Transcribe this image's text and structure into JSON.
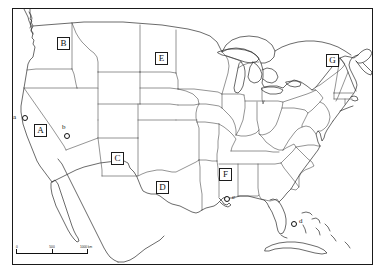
{
  "figure": {
    "background_color": "#ffffff",
    "line_color": "#2b2b2b",
    "frame": true
  },
  "region_labels": [
    {
      "id": "B",
      "label": "B",
      "x": 57,
      "y": 37
    },
    {
      "id": "E",
      "label": "E",
      "x": 155,
      "y": 52
    },
    {
      "id": "G",
      "label": "G",
      "x": 326,
      "y": 54
    },
    {
      "id": "A",
      "label": "A",
      "x": 34,
      "y": 124
    },
    {
      "id": "C",
      "label": "C",
      "x": 111,
      "y": 152
    },
    {
      "id": "D",
      "label": "D",
      "x": 156,
      "y": 181
    },
    {
      "id": "F",
      "label": "F",
      "x": 219,
      "y": 168
    }
  ],
  "point_labels": [
    {
      "id": "a",
      "label": "a",
      "marker_x": 22,
      "marker_y": 115,
      "text_x": 13,
      "text_y": 113
    },
    {
      "id": "b",
      "label": "b",
      "marker_x": 64,
      "marker_y": 133,
      "text_x": 62,
      "text_y": 123
    },
    {
      "id": "c",
      "label": "c",
      "marker_x": 224,
      "marker_y": 196,
      "text_x": 232,
      "text_y": 193
    },
    {
      "id": "d",
      "label": "d",
      "marker_x": 291,
      "marker_y": 221,
      "text_x": 299,
      "text_y": 217
    }
  ],
  "scale_bar": {
    "unit_suffix": "km",
    "ticks": [
      {
        "value": "0",
        "position_pct": 0
      },
      {
        "value": "500",
        "position_pct": 50
      },
      {
        "value": "1000 km",
        "position_pct": 100
      }
    ]
  }
}
